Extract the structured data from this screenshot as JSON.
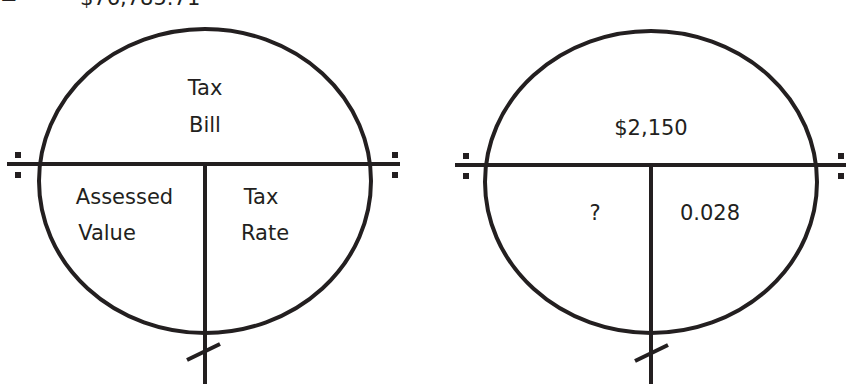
{
  "top_line": {
    "equals": "=",
    "value": "$76,785.71"
  },
  "diagrams": [
    {
      "id": "template",
      "top": [
        "Tax",
        "Bill"
      ],
      "bottom_left": [
        "Assessed",
        "Value"
      ],
      "bottom_right": [
        "Tax",
        "Rate"
      ]
    },
    {
      "id": "example",
      "top": [
        "$2,150"
      ],
      "bottom_left": [
        "?"
      ],
      "bottom_right": [
        "0.028"
      ]
    }
  ],
  "colors": {
    "stroke": "#231f20",
    "background": "#ffffff"
  }
}
